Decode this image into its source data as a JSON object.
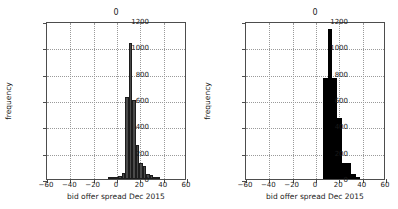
{
  "figure": {
    "width": 398,
    "height": 209,
    "background": "#ffffff",
    "axis_color": "#4d4d4d",
    "grid_color": "#9a9a9a",
    "text_color": "#1a1a1a"
  },
  "panels": [
    {
      "id": "left",
      "title": "0",
      "xlabel": "bid offer spread Dec 2015",
      "ylabel": "frequency",
      "bar_color": "#4a4a4a",
      "bar_edge_color": "#1c1c1c"
    },
    {
      "id": "right",
      "title": "0",
      "xlabel": "bid offer spread Dec 2015",
      "ylabel": "frequency",
      "bar_color": "#000000",
      "bar_edge_color": "#000000"
    }
  ],
  "axis": {
    "xticks": [
      -60,
      -40,
      -20,
      0,
      20,
      40,
      60
    ],
    "xticklabels": [
      "−60",
      "−40",
      "−20",
      "0",
      "20",
      "40",
      "60"
    ],
    "yticks": [
      0,
      200,
      400,
      600,
      800,
      1000,
      1200
    ],
    "yticklabels": [
      "0",
      "200",
      "400",
      "600",
      "800",
      "1000",
      "1200"
    ],
    "xlim": [
      -60,
      60
    ],
    "ylim": [
      0,
      1200
    ]
  },
  "chart_data": [
    {
      "type": "bar",
      "id": "left-histogram",
      "title": "0",
      "xlabel": "bid offer spread Dec 2015",
      "ylabel": "frequency",
      "xlim": [
        -60,
        60
      ],
      "ylim": [
        0,
        1200
      ],
      "grid": true,
      "legend": "none",
      "orientation": "vertical",
      "bins": [
        {
          "x0": -8,
          "x1": -5,
          "value": 8
        },
        {
          "x0": -5,
          "x1": -2,
          "value": 12
        },
        {
          "x0": -2,
          "x1": 1,
          "value": 10
        },
        {
          "x0": 1,
          "x1": 4,
          "value": 20
        },
        {
          "x0": 4,
          "x1": 7,
          "value": 45
        },
        {
          "x0": 7,
          "x1": 10,
          "value": 620
        },
        {
          "x0": 10,
          "x1": 13,
          "value": 1030
        },
        {
          "x0": 13,
          "x1": 16,
          "value": 600
        },
        {
          "x0": 16,
          "x1": 19,
          "value": 262
        },
        {
          "x0": 19,
          "x1": 22,
          "value": 118
        },
        {
          "x0": 22,
          "x1": 25,
          "value": 98
        },
        {
          "x0": 25,
          "x1": 28,
          "value": 40
        },
        {
          "x0": 28,
          "x1": 31,
          "value": 32
        },
        {
          "x0": 31,
          "x1": 34,
          "value": 12
        },
        {
          "x0": 34,
          "x1": 37,
          "value": 8
        }
      ]
    },
    {
      "type": "bar",
      "id": "right-histogram",
      "title": "0",
      "xlabel": "bid offer spread Dec 2015",
      "ylabel": "frequency",
      "xlim": [
        -60,
        60
      ],
      "ylim": [
        0,
        1200
      ],
      "grid": true,
      "legend": "none",
      "orientation": "vertical",
      "bins": [
        {
          "x0": 6,
          "x1": 10,
          "value": 770
        },
        {
          "x0": 10,
          "x1": 14,
          "value": 1140
        },
        {
          "x0": 14,
          "x1": 18,
          "value": 770
        },
        {
          "x0": 18,
          "x1": 22,
          "value": 465
        },
        {
          "x0": 22,
          "x1": 26,
          "value": 120
        },
        {
          "x0": 26,
          "x1": 30,
          "value": 118
        },
        {
          "x0": 30,
          "x1": 34,
          "value": 40
        },
        {
          "x0": 34,
          "x1": 38,
          "value": 12
        }
      ]
    }
  ]
}
